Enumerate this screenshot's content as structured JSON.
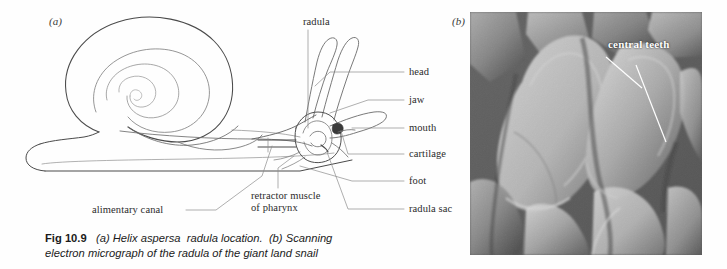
{
  "figure": {
    "panel_a_letter": "(a)",
    "panel_b_letter": "(b)",
    "caption": {
      "fig_number": "Fig 10.9",
      "part_a": "(a) Helix aspersa",
      "part_a_italic": "radula location.",
      "part_b": "(b) Scanning",
      "line2": "electron micrograph of the radula of the giant land snail"
    }
  },
  "diagram": {
    "labels": {
      "radula": "radula",
      "head": "head",
      "jaw": "jaw",
      "mouth": "mouth",
      "cartilage": "cartilage",
      "foot": "foot",
      "radula_sac": "radula sac",
      "alimentary_canal": "alimentary canal",
      "retractor_muscle": "retractor muscle of pharynx"
    }
  },
  "micrograph": {
    "label": "central teeth",
    "description": "Scanning electron micrograph of the radula of the giant land snail"
  },
  "colors": {
    "ink": "#2b2b2b",
    "line": "#5a5a5a",
    "paper": "#fefefe",
    "label_white": "#ffffff"
  }
}
